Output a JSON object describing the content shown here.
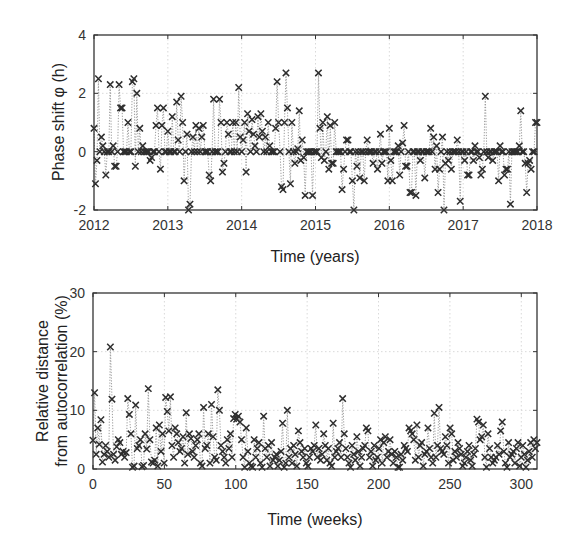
{
  "chart_data": [
    {
      "id": "phase",
      "type": "scatter",
      "marker": "x",
      "connector": "dotted-line",
      "title": "",
      "xlabel": "Time (years)",
      "ylabel": "Phase shift φ (h)",
      "xlim": [
        2012,
        2018
      ],
      "ylim": [
        -2,
        4
      ],
      "xticks": [
        2012,
        2013,
        2014,
        2015,
        2016,
        2017,
        2018
      ],
      "yticks": [
        -2,
        0,
        2,
        4
      ],
      "grid": true,
      "legend": null,
      "x": [
        2012.0,
        2012.02,
        2012.04,
        2012.06,
        2012.08,
        2012.1,
        2012.12,
        2012.14,
        2012.16,
        2012.18,
        2012.2,
        2012.22,
        2012.24,
        2012.26,
        2012.28,
        2012.3,
        2012.32,
        2012.34,
        2012.36,
        2012.38,
        2012.4,
        2012.42,
        2012.44,
        2012.46,
        2012.48,
        2012.5,
        2012.52,
        2012.54,
        2012.56,
        2012.58,
        2012.6,
        2012.62,
        2012.64,
        2012.66,
        2012.68,
        2012.7,
        2012.72,
        2012.74,
        2012.76,
        2012.78,
        2012.8,
        2012.82,
        2012.84,
        2012.86,
        2012.88,
        2012.9,
        2012.92,
        2012.94,
        2012.96,
        2012.98,
        2013.0,
        2013.02,
        2013.04,
        2013.06,
        2013.08,
        2013.1,
        2013.12,
        2013.14,
        2013.16,
        2013.18,
        2013.2,
        2013.22,
        2013.24,
        2013.26,
        2013.28,
        2013.3,
        2013.32,
        2013.34,
        2013.36,
        2013.38,
        2013.4,
        2013.42,
        2013.44,
        2013.46,
        2013.48,
        2013.5,
        2013.52,
        2013.54,
        2013.56,
        2013.58,
        2013.6,
        2013.62,
        2013.64,
        2013.66,
        2013.68,
        2013.7,
        2013.72,
        2013.74,
        2013.76,
        2013.78,
        2013.8,
        2013.82,
        2013.84,
        2013.86,
        2013.88,
        2013.9,
        2013.92,
        2013.94,
        2013.96,
        2013.98,
        2014.0,
        2014.02,
        2014.04,
        2014.06,
        2014.08,
        2014.1,
        2014.12,
        2014.14,
        2014.16,
        2014.18,
        2014.2,
        2014.22,
        2014.24,
        2014.26,
        2014.28,
        2014.3,
        2014.32,
        2014.34,
        2014.36,
        2014.38,
        2014.4,
        2014.42,
        2014.44,
        2014.46,
        2014.48,
        2014.5,
        2014.52,
        2014.54,
        2014.56,
        2014.58,
        2014.6,
        2014.62,
        2014.64,
        2014.66,
        2014.68,
        2014.7,
        2014.72,
        2014.74,
        2014.76,
        2014.78,
        2014.8,
        2014.82,
        2014.84,
        2014.86,
        2014.88,
        2014.9,
        2014.92,
        2014.94,
        2014.96,
        2014.98,
        2015.0,
        2015.02,
        2015.04,
        2015.06,
        2015.08,
        2015.1,
        2015.12,
        2015.14,
        2015.16,
        2015.18,
        2015.2,
        2015.22,
        2015.24,
        2015.26,
        2015.28,
        2015.3,
        2015.32,
        2015.34,
        2015.36,
        2015.38,
        2015.4,
        2015.42,
        2015.44,
        2015.46,
        2015.48,
        2015.5,
        2015.52,
        2015.54,
        2015.56,
        2015.58,
        2015.6,
        2015.62,
        2015.64,
        2015.66,
        2015.68,
        2015.7,
        2015.72,
        2015.74,
        2015.76,
        2015.78,
        2015.8,
        2015.82,
        2015.84,
        2015.86,
        2015.88,
        2015.9,
        2015.92,
        2015.94,
        2015.96,
        2015.98,
        2016.0,
        2016.02,
        2016.04,
        2016.06,
        2016.08,
        2016.1,
        2016.12,
        2016.14,
        2016.16,
        2016.18,
        2016.2,
        2016.22,
        2016.24,
        2016.26,
        2016.28,
        2016.3,
        2016.32,
        2016.34,
        2016.36,
        2016.38,
        2016.4,
        2016.42,
        2016.44,
        2016.46,
        2016.48,
        2016.5,
        2016.52,
        2016.54,
        2016.56,
        2016.58,
        2016.6,
        2016.62,
        2016.64,
        2016.66,
        2016.68,
        2016.7,
        2016.72,
        2016.74,
        2016.76,
        2016.78,
        2016.8,
        2016.82,
        2016.84,
        2016.86,
        2016.88,
        2016.9,
        2016.92,
        2016.94,
        2016.96,
        2016.98,
        2017.0,
        2017.02,
        2017.04,
        2017.06,
        2017.08,
        2017.1,
        2017.12,
        2017.14,
        2017.16,
        2017.18,
        2017.2,
        2017.22,
        2017.24,
        2017.26,
        2017.28,
        2017.3,
        2017.32,
        2017.34,
        2017.36,
        2017.38,
        2017.4,
        2017.42,
        2017.44,
        2017.46,
        2017.48,
        2017.5,
        2017.52,
        2017.54,
        2017.56,
        2017.58,
        2017.6,
        2017.62,
        2017.64,
        2017.66,
        2017.68,
        2017.7,
        2017.72,
        2017.74,
        2017.76,
        2017.78,
        2017.8,
        2017.82,
        2017.84,
        2017.86,
        2017.88,
        2017.9,
        2017.92,
        2017.94,
        2017.96,
        2017.98,
        2018.0
      ],
      "y": [
        0.8,
        -1.1,
        -0.3,
        2.5,
        0.0,
        0.5,
        0.2,
        0.0,
        -0.8,
        0.0,
        0.0,
        2.3,
        0.0,
        0.2,
        -0.5,
        -0.5,
        0.0,
        2.3,
        1.5,
        1.5,
        0.0,
        0.0,
        0.0,
        1.0,
        0.0,
        0.0,
        2.4,
        2.5,
        -0.5,
        2.0,
        0.0,
        0.8,
        0.0,
        0.2,
        0.0,
        0.0,
        0.0,
        0.0,
        -0.3,
        -0.2,
        0.0,
        0.0,
        0.9,
        1.5,
        0.0,
        -0.6,
        0.9,
        1.5,
        0.0,
        0.0,
        0.7,
        0.0,
        0.0,
        1.2,
        0.0,
        0.0,
        1.7,
        0.4,
        0.0,
        1.9,
        1.0,
        -1.0,
        0.0,
        0.6,
        -2.0,
        -1.8,
        0.0,
        0.5,
        0.0,
        0.9,
        0.0,
        0.8,
        0.0,
        0.5,
        0.9,
        0.0,
        0.0,
        0.0,
        -0.8,
        -1.0,
        0.0,
        1.8,
        0.0,
        0.0,
        0.0,
        1.8,
        1.0,
        -0.7,
        -0.4,
        0.0,
        1.0,
        0.6,
        0.0,
        0.0,
        1.0,
        0.0,
        1.0,
        0.0,
        2.2,
        0.5,
        0.0,
        0.4,
        1.0,
        -0.7,
        1.3,
        0.7,
        0.0,
        1.1,
        0.6,
        0.2,
        0.0,
        1.2,
        0.5,
        1.3,
        0.7,
        0.0,
        0.5,
        0.0,
        1.0,
        0.2,
        0.0,
        0.0,
        0.0,
        0.8,
        2.4,
        1.0,
        0.0,
        -1.2,
        -1.3,
        1.0,
        2.7,
        1.5,
        0.0,
        -1.1,
        1.0,
        0.0,
        -0.4,
        0.0,
        0.1,
        1.4,
        -0.3,
        0.4,
        -0.2,
        -1.5,
        0.0,
        0.0,
        0.0,
        0.0,
        -1.5,
        0.0,
        0.0,
        0.0,
        2.7,
        0.8,
        -0.2,
        1.0,
        -0.3,
        0.0,
        1.2,
        -0.6,
        0.9,
        -0.4,
        -0.4,
        1.0,
        0.0,
        0.0,
        0.0,
        0.0,
        -1.3,
        -0.6,
        0.0,
        0.4,
        0.4,
        0.0,
        0.0,
        -1.0,
        -2.0,
        0.0,
        -0.5,
        0.0,
        -0.9,
        0.0,
        0.0,
        -1.0,
        0.0,
        0.4,
        0.0,
        0.0,
        0.0,
        -0.4,
        0.0,
        0.0,
        -0.6,
        0.0,
        0.6,
        -0.4,
        0.0,
        0.0,
        0.0,
        -1.0,
        0.8,
        -0.3,
        -1.0,
        0.0,
        0.0,
        0.0,
        0.2,
        -0.8,
        0.0,
        0.3,
        0.9,
        -0.5,
        -0.5,
        0.0,
        -1.4,
        -1.4,
        0.0,
        0.0,
        -1.5,
        0.0,
        0.0,
        -0.3,
        0.0,
        0.0,
        -0.9,
        0.0,
        0.0,
        0.0,
        0.8,
        0.0,
        0.5,
        -0.6,
        0.2,
        -1.4,
        -0.6,
        0.0,
        0.5,
        -2.0,
        -0.4,
        0.0,
        -0.3,
        0.0,
        -0.6,
        0.0,
        0.0,
        0.0,
        0.4,
        0.0,
        -1.7,
        0.0,
        0.0,
        -0.3,
        0.0,
        -0.8,
        -0.8,
        0.0,
        0.0,
        -0.3,
        0.2,
        0.0,
        0.0,
        -0.2,
        -0.8,
        -0.6,
        0.0,
        1.9,
        0.0,
        -0.2,
        0.0,
        0.0,
        -0.3,
        0.0,
        0.0,
        0.0,
        -1.0,
        0.2,
        0.0,
        0.0,
        -0.8,
        -0.6,
        -0.6,
        0.0,
        -1.8,
        0.0,
        0.0,
        0.0,
        0.0,
        0.0,
        0.2,
        1.4,
        0.0,
        0.0,
        -0.4,
        -1.4,
        -0.4,
        -0.3,
        -0.6,
        0.0,
        0.0,
        1.0,
        1.0,
        -0.8,
        0.4,
        -0.2,
        -0.1,
        0.0,
        1.1
      ]
    },
    {
      "id": "distance",
      "type": "scatter",
      "marker": "x",
      "connector": "dotted-line",
      "title": "",
      "xlabel": "Time (weeks)",
      "ylabel": "Relative distance from autocorrelation (%)",
      "ylabel_lines": [
        "Relative distance",
        "from autocorrelation (%)"
      ],
      "xlim": [
        0,
        311
      ],
      "ylim": [
        0,
        30
      ],
      "xticks": [
        0,
        50,
        100,
        150,
        200,
        250,
        300
      ],
      "yticks": [
        0,
        10,
        20,
        30
      ],
      "grid": true,
      "legend": null,
      "y": [
        4.9,
        13.0,
        2.5,
        7.0,
        4.2,
        8.4,
        1.2,
        2.5,
        4.0,
        3.0,
        2.0,
        20.8,
        11.9,
        2.5,
        1.5,
        3.8,
        5.0,
        4.5,
        2.5,
        3.0,
        2.0,
        2.8,
        12.0,
        9.3,
        6.0,
        0.3,
        0.5,
        10.9,
        3.5,
        4.0,
        5.0,
        0.4,
        0.6,
        6.0,
        3.4,
        13.7,
        5.0,
        1.2,
        1.0,
        1.5,
        7.0,
        0.5,
        7.5,
        3.0,
        6.0,
        1.0,
        12.2,
        9.8,
        6.5,
        12.3,
        4.0,
        2.0,
        7.0,
        6.0,
        4.5,
        3.0,
        3.5,
        5.5,
        1.0,
        9.6,
        2.5,
        6.0,
        5.2,
        3.0,
        2.0,
        4.0,
        5.0,
        6.0,
        1.0,
        0.5,
        10.5,
        3.5,
        4.0,
        6.0,
        1.0,
        11.0,
        5.5,
        2.0,
        1.5,
        13.5,
        10.0,
        4.0,
        3.0,
        2.0,
        1.0,
        5.0,
        3.5,
        6.0,
        2.0,
        8.6,
        9.3,
        8.5,
        9.0,
        8.0,
        5.0,
        2.0,
        0.3,
        7.0,
        3.0,
        1.0,
        0.5,
        0.3,
        5.0,
        2.0,
        3.5,
        4.5,
        1.0,
        0.3,
        9.0,
        3.5,
        2.0,
        4.0,
        0.5,
        4.5,
        1.5,
        2.0,
        2.5,
        0.5,
        1.5,
        3.0,
        7.8,
        0.3,
        1.0,
        10.0,
        2.0,
        3.5,
        1.0,
        4.0,
        2.5,
        0.5,
        6.5,
        4.5,
        3.0,
        2.0,
        3.5,
        1.0,
        0.5,
        2.0,
        3.5,
        3.0,
        4.0,
        7.5,
        2.0,
        3.5,
        1.5,
        2.5,
        6.0,
        4.0,
        1.5,
        3.5,
        1.0,
        0.5,
        7.8,
        2.0,
        3.0,
        3.5,
        4.5,
        2.0,
        12.0,
        6.0,
        3.5,
        2.0,
        1.0,
        0.3,
        4.0,
        2.5,
        1.5,
        5.5,
        3.0,
        0.5,
        2.0,
        3.5,
        4.0,
        7.0,
        6.5,
        2.0,
        3.0,
        0.5,
        4.0,
        1.5,
        2.0,
        3.5,
        5.0,
        1.0,
        4.5,
        5.5,
        2.0,
        3.0,
        5.0,
        2.5,
        1.0,
        3.0,
        2.0,
        0.3,
        0.3,
        2.5,
        1.5,
        4.0,
        3.5,
        3.0,
        7.0,
        6.5,
        6.0,
        5.0,
        1.5,
        7.5,
        2.0,
        4.0,
        4.5,
        0.5,
        2.5,
        3.0,
        7.0,
        3.5,
        2.0,
        1.0,
        9.5,
        2.0,
        4.0,
        10.5,
        3.5,
        3.0,
        2.5,
        5.5,
        4.0,
        1.0,
        7.0,
        6.0,
        1.5,
        3.0,
        2.0,
        4.5,
        3.5,
        2.5,
        0.5,
        1.0,
        2.0,
        3.0,
        4.0,
        1.5,
        0.5,
        2.5,
        3.5,
        8.5,
        8.0,
        5.0,
        5.5,
        7.5,
        2.0,
        0.3,
        6.0,
        3.5,
        2.0,
        1.0,
        1.5,
        2.0,
        4.0,
        2.5,
        6.5,
        8.0,
        3.0,
        1.0,
        0.3,
        4.5,
        2.0,
        2.5,
        3.0,
        1.0,
        3.5,
        4.5,
        0.5,
        2.0,
        4.0,
        2.5,
        0.3,
        1.5,
        3.0,
        4.5,
        2.0,
        5.0,
        3.5,
        4.5
      ]
    }
  ],
  "colors": {
    "marker": "#2e2e2e",
    "connector": "#9a9a9a",
    "grid": "#cfcfcf",
    "frame": "#333333",
    "text": "#333333"
  }
}
